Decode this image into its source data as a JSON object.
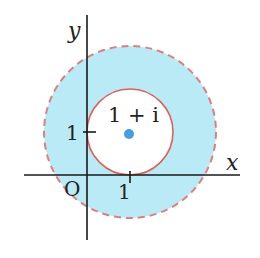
{
  "diagram": {
    "axes": {
      "x_label": "x",
      "y_label": "y",
      "origin_label": "O"
    },
    "ticks": {
      "x_tick": "1",
      "y_tick": "1"
    },
    "center_point": {
      "label": "1 + i",
      "re": 1,
      "im": 1
    },
    "inner_circle": {
      "radius": 1,
      "style": "solid"
    },
    "outer_circle": {
      "radius": 2,
      "style": "dashed"
    },
    "region": "1 <= |z - (1+i)| < 2",
    "colors": {
      "fill": "#b9eaf5",
      "outer_stroke": "#d98080",
      "inner_stroke": "#d9625a",
      "dot": "#4a9be0",
      "axis": "#1a1a1a"
    }
  }
}
